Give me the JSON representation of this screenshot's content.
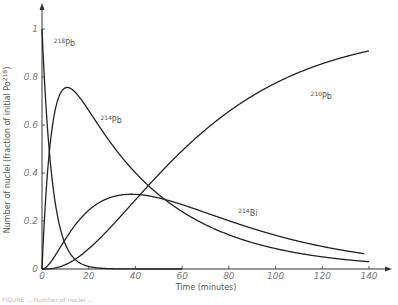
{
  "chart_data": {
    "type": "line",
    "title": "",
    "xlabel": "Time (minutes)",
    "ylabel": "Number of nuclei (fraction of initial Po",
    "ylabel_sup": "218",
    "ylabel_suffix": ")",
    "xlim": [
      0,
      140
    ],
    "ylim": [
      0,
      1
    ],
    "x_ticks": [
      0,
      20,
      40,
      60,
      80,
      100,
      120,
      140
    ],
    "x_tick_labels": [
      "0",
      "20",
      "40",
      "60",
      "80",
      "100",
      "120",
      "140"
    ],
    "y_ticks": [
      0,
      0.2,
      0.4,
      0.6,
      0.8,
      1
    ],
    "y_tick_labels": [
      "0",
      "0.2",
      "0.4",
      "0.6",
      "0.8",
      "1"
    ],
    "grid": false,
    "legend": "inline curve labels",
    "x": [
      0,
      5,
      10,
      13,
      20,
      30,
      40,
      50,
      60,
      80,
      100,
      120,
      140
    ],
    "series": [
      {
        "name": "218Pb",
        "label_mass": "218",
        "label_elem": "Pb",
        "values": [
          1.0,
          0.32,
          0.1,
          0.05,
          0.01,
          0.001,
          0.0,
          0.0,
          0.0,
          0.0,
          0.0,
          0.0,
          0.0
        ]
      },
      {
        "name": "214Pb",
        "label_mass": "214",
        "label_elem": "Pb",
        "values": [
          0.0,
          0.59,
          0.73,
          0.76,
          0.7,
          0.55,
          0.42,
          0.33,
          0.26,
          0.16,
          0.097,
          0.059,
          0.036
        ]
      },
      {
        "name": "214Bi",
        "label_mass": "214",
        "label_elem": "Bi",
        "values": [
          0.0,
          0.03,
          0.1,
          0.14,
          0.21,
          0.28,
          0.3,
          0.29,
          0.27,
          0.2,
          0.135,
          0.088,
          0.056
        ]
      },
      {
        "name": "210Pb",
        "label_mass": "210",
        "label_elem": "Pb",
        "values": [
          0.0,
          0.01,
          0.05,
          0.07,
          0.17,
          0.31,
          0.43,
          0.53,
          0.61,
          0.74,
          0.83,
          0.89,
          0.92
        ]
      }
    ],
    "half_lives_min": {
      "218Pb": 3.05,
      "214Pb": 26.8,
      "214Bi": 19.9
    },
    "label_positions": [
      {
        "series": "218Pb",
        "t": 5,
        "y": 0.93
      },
      {
        "series": "214Pb",
        "t": 25,
        "y": 0.61
      },
      {
        "series": "214Bi",
        "t": 84,
        "y": 0.22
      },
      {
        "series": "210Pb",
        "t": 115,
        "y": 0.71
      }
    ]
  },
  "caption": "FIGURE ... Number of nuclei ..."
}
